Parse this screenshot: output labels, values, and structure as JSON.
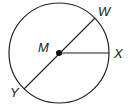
{
  "diagram": {
    "type": "circle-geometry",
    "center_label": "M",
    "points": [
      {
        "label": "W",
        "role": "endpoint of diameter on circle"
      },
      {
        "label": "X",
        "role": "endpoint of radius on circle"
      },
      {
        "label": "Y",
        "role": "endpoint of diameter on circle"
      }
    ],
    "segments": [
      "WY (diameter through M)",
      "MX (radius)"
    ],
    "colors": {
      "stroke": "#222222",
      "background": "#ffffff"
    }
  }
}
